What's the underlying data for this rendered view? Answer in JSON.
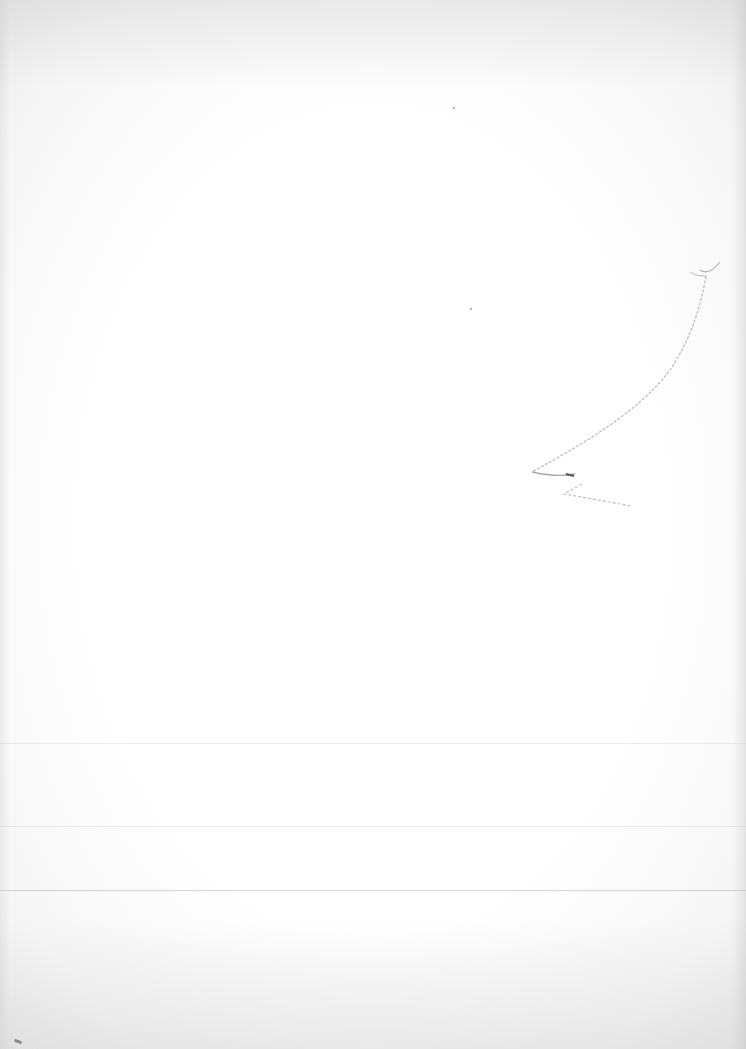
{
  "page": {
    "type": "blank scanned page",
    "background_color": "#fcfcfc",
    "text_content": "",
    "annotations": [
      {
        "kind": "pencil-stroke",
        "description": "faint curved pencil line with small hook at top and zigzag at bottom"
      }
    ],
    "rules": [
      {
        "y": 743,
        "strength": "faint"
      },
      {
        "y": 826,
        "strength": "faint"
      },
      {
        "y": 890,
        "strength": "visible"
      }
    ]
  }
}
